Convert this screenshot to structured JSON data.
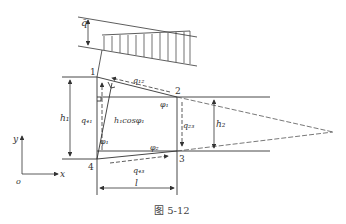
{
  "figure": {
    "caption": "图 5-12",
    "nodes": [
      {
        "id": "1",
        "label": "1"
      },
      {
        "id": "2",
        "label": "2"
      },
      {
        "id": "3",
        "label": "3"
      },
      {
        "id": "4",
        "label": "4"
      }
    ],
    "labels": {
      "q_bar": "q̄",
      "q12": "q₁₂",
      "q23": "q₂₃",
      "q41": "q₄₁",
      "q43": "q₄₃",
      "h1": "h₁",
      "h2": "h₂",
      "h1cos": "h₁cosφ₁",
      "phi1_top": "φ₁",
      "phi1_left": "φ₁",
      "phi2": "φ₂",
      "l": "l",
      "x_axis": "x",
      "y_axis": "y",
      "origin": "o"
    },
    "colors": {
      "line": "#333333",
      "text": "#333333"
    }
  }
}
